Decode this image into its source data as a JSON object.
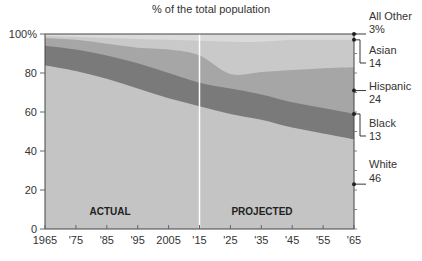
{
  "chart_data": {
    "type": "area",
    "stacked": true,
    "title": "% of the total population",
    "xlabel": "",
    "ylabel": "",
    "ylim": [
      0,
      100
    ],
    "y_ticks": [
      "0",
      "20",
      "40",
      "60",
      "80",
      "100%"
    ],
    "x": [
      1965,
      1975,
      1985,
      1995,
      2005,
      2015,
      2025,
      2035,
      2045,
      2055,
      2065
    ],
    "x_tick_labels": [
      "1965",
      "'75",
      "'85",
      "'95",
      "2005",
      "'15",
      "'25",
      "'35",
      "'45",
      "'55",
      "'65"
    ],
    "series": [
      {
        "name": "White",
        "color": "#c4c4c4",
        "values": [
          84,
          81,
          77,
          72,
          67,
          63,
          59,
          56,
          52,
          49,
          46
        ]
      },
      {
        "name": "Black",
        "color": "#7a7a7a",
        "values": [
          10,
          11,
          12,
          13,
          13,
          12,
          13,
          13,
          13,
          13,
          13
        ]
      },
      {
        "name": "Hispanic",
        "color": "#a6a6a6",
        "values": [
          4,
          5,
          6,
          8,
          12,
          14,
          7.5,
          11.5,
          16.5,
          20.5,
          24
        ]
      },
      {
        "name": "Asian",
        "color": "#c9c9c9",
        "values": [
          1,
          1.5,
          3,
          4.5,
          5,
          7.5,
          16.5,
          15.5,
          15.5,
          14.5,
          14
        ]
      },
      {
        "name": "All Other",
        "color": "#dadada",
        "values": [
          1,
          1.5,
          2,
          2.5,
          3,
          3.5,
          4,
          4,
          3,
          3,
          3
        ]
      }
    ],
    "cumulative_tops": {
      "White": [
        84,
        81,
        77,
        72,
        67,
        63,
        59,
        56,
        52,
        49,
        46
      ],
      "Black": [
        94,
        92,
        89,
        85,
        80,
        75,
        72,
        69,
        65,
        62,
        59
      ],
      "Hispanic": [
        98,
        97,
        95,
        93,
        92,
        89,
        79.5,
        80.5,
        81.5,
        82.5,
        83
      ],
      "Asian": [
        99,
        98.5,
        98,
        97.5,
        97,
        96.5,
        96,
        96,
        97,
        97,
        97
      ],
      "All Other": [
        100,
        100,
        100,
        100,
        100,
        100,
        100,
        100,
        100,
        100,
        100
      ]
    },
    "end_labels": [
      {
        "name": "All Other",
        "value": "3%"
      },
      {
        "name": "Asian",
        "value": "14"
      },
      {
        "name": "Hispanic",
        "value": "24"
      },
      {
        "name": "Black",
        "value": "13"
      },
      {
        "name": "White",
        "value": "46"
      }
    ],
    "divider_year": 2015,
    "annotations": [
      {
        "text": "ACTUAL",
        "x": 1990
      },
      {
        "text": "PROJECTED",
        "x": 2040
      }
    ],
    "grid": false,
    "legend_position": "right (direct labels)"
  },
  "title": "% of the total population",
  "phases": {
    "actual": "ACTUAL",
    "projected": "PROJECTED"
  }
}
